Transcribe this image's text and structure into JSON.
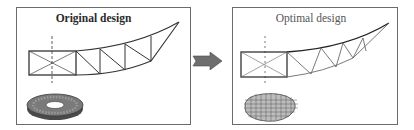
{
  "diagram": {
    "type": "design-optimization-comparison",
    "panels": [
      {
        "id": "original",
        "title": "Original design",
        "title_weight": "bold",
        "contents": [
          "truss-blade-structure",
          "solid-annular-disk-model"
        ]
      },
      {
        "id": "optimal",
        "title": "Optimal design",
        "title_weight": "normal",
        "contents": [
          "optimized-truss-blade-structure",
          "lattice-mesh-hub-model"
        ]
      }
    ],
    "connector": {
      "icon": "right-arrow-icon",
      "from": "original",
      "to": "optimal",
      "color": "#6e6e6e"
    },
    "colors": {
      "line": "#333333",
      "optimal_line": "#5a5a5a",
      "frame": "#6b6b6b",
      "disk": "#5a5a5a"
    }
  }
}
